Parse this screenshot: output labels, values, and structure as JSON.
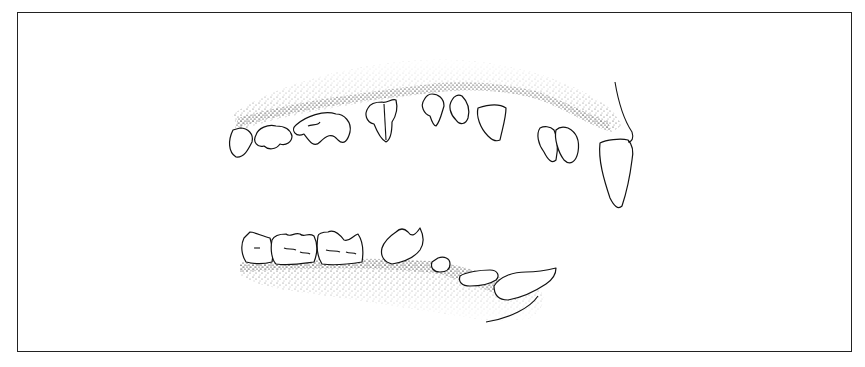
{
  "figure": {
    "style": "black-and-white pen-and-ink stipple illustration",
    "colors": {
      "ink": "#111111",
      "background": "#ffffff",
      "frame": "#222222"
    },
    "upper_jaw": {
      "label": "",
      "teeth_count_drawn": 11
    },
    "lower_jaw": {
      "label": "",
      "teeth_count_drawn": 9
    }
  }
}
